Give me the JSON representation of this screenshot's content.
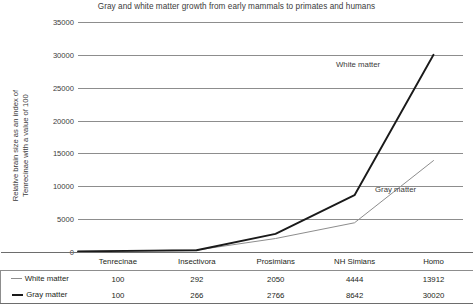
{
  "chart_data": {
    "type": "line",
    "title": "Gray and white matter growth from early mammals to primates and humans",
    "xlabel": "",
    "ylabel": "Relative brain size as an  index of Tenrecinae with a value of 100",
    "ylabel_line1": "Relative brain size as an  index of",
    "ylabel_line2": "Tenrecinae with a value of 100",
    "categories": [
      "Tenrecinae",
      "Insectivora",
      "Prosimians",
      "NH Simians",
      "Homo"
    ],
    "series": [
      {
        "name": "White matter",
        "values": [
          100,
          292,
          2050,
          4444,
          13912
        ],
        "color": "#8d8d8d"
      },
      {
        "name": "Gray matter",
        "values": [
          100,
          266,
          2766,
          8642,
          30020
        ],
        "color": "#1a1a1a"
      }
    ],
    "ylim": [
      0,
      35000
    ],
    "ytick_values": [
      35000,
      30000,
      25000,
      20000,
      15000,
      10000,
      5000,
      0
    ],
    "ytick_labels": [
      "35000",
      "30000",
      "25000",
      "20000",
      "15000",
      "10000",
      "5000",
      "0"
    ],
    "grid": true,
    "legend_position": "table-row-labels",
    "annotations": [
      {
        "text": "White matter",
        "series": "White matter"
      },
      {
        "text": "Gray matter",
        "series": "Gray matter"
      }
    ]
  },
  "table": {
    "header": [
      "",
      "Tenrecinae",
      "Insectivora",
      "Prosimians",
      "NH Simians",
      "Homo"
    ],
    "rows": [
      {
        "label": "White matter",
        "values": [
          "100",
          "292",
          "2050",
          "4444",
          "13912"
        ]
      },
      {
        "label": "Gray matter",
        "values": [
          "100",
          "266",
          "2766",
          "8642",
          "30020"
        ]
      }
    ]
  },
  "colors": {
    "white_matter": "#8d8d8d",
    "gray_matter": "#1a1a1a",
    "gridline": "#8d8d8d",
    "text": "#3b3b3b",
    "background": "#ffffff"
  }
}
